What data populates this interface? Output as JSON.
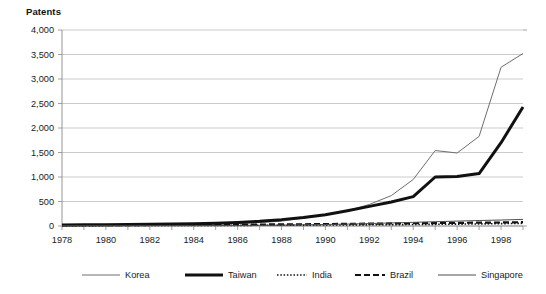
{
  "chart_data": {
    "type": "line",
    "title": "",
    "ylabel": "Patents",
    "xlabel": "",
    "ylim": [
      0,
      4000
    ],
    "xlim": [
      1978,
      1999
    ],
    "grid": true,
    "legend_position": "bottom",
    "y_ticks": [
      0,
      500,
      1000,
      1500,
      2000,
      2500,
      3000,
      3500,
      4000
    ],
    "y_tick_labels": [
      "0",
      "500",
      "1,000",
      "1,500",
      "2,000",
      "2,500",
      "3,000",
      "3,500",
      "4,000"
    ],
    "x_ticks": [
      1978,
      1979,
      1980,
      1981,
      1982,
      1983,
      1984,
      1985,
      1986,
      1987,
      1988,
      1989,
      1990,
      1991,
      1992,
      1993,
      1994,
      1995,
      1996,
      1997,
      1998,
      1999
    ],
    "x_tick_labels": [
      "1978",
      "1980",
      "1982",
      "1984",
      "1986",
      "1988",
      "1990",
      "1992",
      "1994",
      "1996",
      "1998"
    ],
    "x_labeled_ticks": [
      1978,
      1980,
      1982,
      1984,
      1986,
      1988,
      1990,
      1992,
      1994,
      1996,
      1998
    ],
    "x": [
      1978,
      1979,
      1980,
      1981,
      1982,
      1983,
      1984,
      1985,
      1986,
      1987,
      1988,
      1989,
      1990,
      1991,
      1992,
      1993,
      1994,
      1995,
      1996,
      1997,
      1998,
      1999
    ],
    "series": [
      {
        "name": "Korea",
        "color": "#6e6e6e",
        "width": 1.0,
        "dash": "none",
        "values": [
          20,
          20,
          22,
          25,
          28,
          32,
          38,
          45,
          55,
          70,
          100,
          160,
          230,
          310,
          440,
          620,
          950,
          1540,
          1490,
          1830,
          3240,
          3520
        ]
      },
      {
        "name": "Taiwan",
        "color": "#111111",
        "width": 3.0,
        "dash": "none",
        "values": [
          22,
          24,
          26,
          30,
          34,
          40,
          48,
          58,
          72,
          95,
          130,
          175,
          230,
          310,
          400,
          490,
          600,
          1000,
          1010,
          1070,
          1700,
          2430
        ]
      },
      {
        "name": "India",
        "color": "#111111",
        "width": 1.6,
        "dash": "1.5,1.8",
        "values": [
          8,
          8,
          9,
          9,
          10,
          10,
          11,
          12,
          13,
          14,
          16,
          18,
          20,
          22,
          24,
          27,
          30,
          34,
          38,
          42,
          48,
          55
        ]
      },
      {
        "name": "Brazil",
        "color": "#111111",
        "width": 2.2,
        "dash": "6,3",
        "values": [
          15,
          16,
          17,
          18,
          20,
          21,
          23,
          25,
          27,
          30,
          33,
          36,
          40,
          44,
          48,
          52,
          56,
          60,
          64,
          68,
          72,
          78
        ]
      },
      {
        "name": "Singapore",
        "color": "#4f4f4f",
        "width": 1.0,
        "dash": "none",
        "values": [
          4,
          4,
          5,
          5,
          6,
          7,
          8,
          9,
          11,
          14,
          18,
          24,
          31,
          40,
          50,
          62,
          75,
          88,
          100,
          112,
          122,
          135
        ]
      }
    ]
  },
  "legend": {
    "items": [
      {
        "label": "Korea"
      },
      {
        "label": "Taiwan"
      },
      {
        "label": "India"
      },
      {
        "label": "Brazil"
      },
      {
        "label": "Singapore"
      }
    ]
  }
}
